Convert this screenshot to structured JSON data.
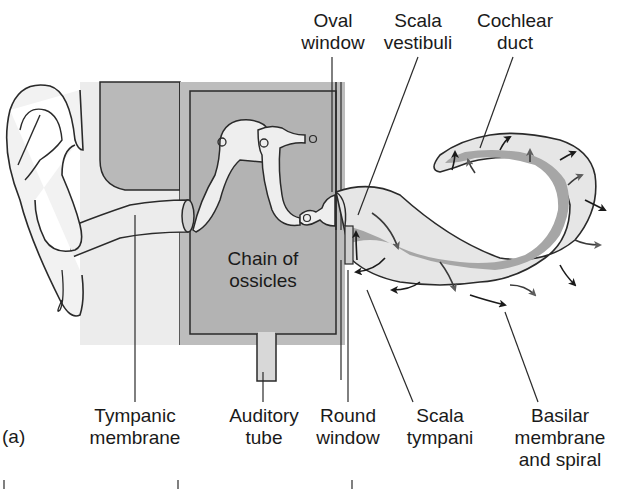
{
  "figure": {
    "panel_label": "(a)",
    "colors": {
      "outline": "#2a2a2a",
      "light_fill": "#e8e8e8",
      "mid_fill": "#b8b8b8",
      "duct_fill": "#a0a0a0",
      "arrow_dark": "#1a1a1a",
      "arrow_gray": "#6a6a6a",
      "background": "#ffffff"
    },
    "labels": {
      "top": [
        {
          "id": "oval-window",
          "line1": "Oval",
          "line2": "window"
        },
        {
          "id": "scala-vestibuli",
          "line1": "Scala",
          "line2": "vestibuli"
        },
        {
          "id": "cochlear-duct",
          "line1": "Cochlear",
          "line2": "duct"
        }
      ],
      "center": {
        "id": "chain-of-ossicles",
        "line1": "Chain of",
        "line2": "ossicles"
      },
      "bottom": [
        {
          "id": "tympanic-membrane",
          "line1": "Tympanic",
          "line2": "membrane"
        },
        {
          "id": "auditory-tube",
          "line1": "Auditory",
          "line2": "tube"
        },
        {
          "id": "round-window",
          "line1": "Round",
          "line2": "window"
        },
        {
          "id": "scala-tympani",
          "line1": "Scala",
          "line2": "tympani"
        },
        {
          "id": "basilar-membrane",
          "line1": "Basilar",
          "line2": "membrane",
          "line3": "and spiral"
        }
      ]
    }
  }
}
